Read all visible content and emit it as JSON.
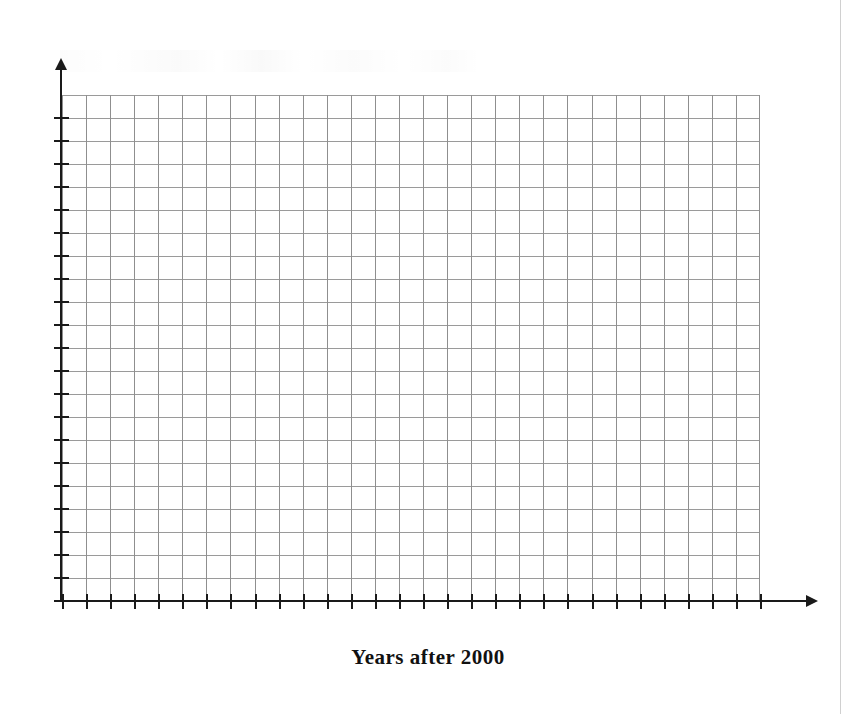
{
  "page": {
    "width": 856,
    "height": 714,
    "background_color": "#ffffff"
  },
  "axis_title": "Years after 2000",
  "chart_data": {
    "type": "line",
    "title": "",
    "subtitle": "",
    "xlabel": "Years after 2000",
    "ylabel": "",
    "series": [],
    "categories": [],
    "x": [],
    "values": [],
    "annotations": [],
    "legend": {
      "entries": [],
      "position": "none"
    },
    "grid": {
      "visible": true,
      "columns": 29,
      "rows": 22,
      "cell_width_px": 24,
      "cell_height_px": 23,
      "line_color": "#8f8f8f"
    },
    "axes": {
      "x": {
        "tick_count": 30,
        "tick_labels": [],
        "arrow": true,
        "color": "#1a1a1a"
      },
      "y": {
        "tick_count": 22,
        "tick_labels": [],
        "arrow": true,
        "color": "#1a1a1a"
      }
    },
    "xlim": null,
    "ylim": null,
    "note": "Blank printed coordinate grid with unlabeled tick marks; no data plotted."
  },
  "colors": {
    "axis": "#1a1a1a",
    "grid_line": "#8f8f8f",
    "page_edge": "#d0d0d0",
    "text": "#111111"
  }
}
